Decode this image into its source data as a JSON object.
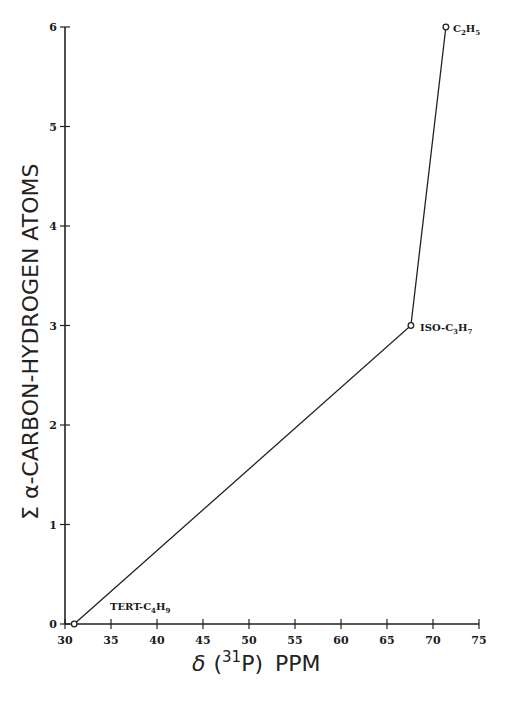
{
  "chart_data": {
    "type": "line",
    "title": "",
    "xlabel": "δ (31P) PPM",
    "ylabel": "Σ α-CARBON-HYDROGEN ATOMS",
    "xlim": [
      30,
      75
    ],
    "ylim": [
      0,
      6
    ],
    "x_ticks": [
      30,
      35,
      40,
      45,
      50,
      55,
      60,
      65,
      70,
      75
    ],
    "y_ticks": [
      0,
      1,
      2,
      3,
      4,
      5,
      6
    ],
    "grid": false,
    "legend": null,
    "series": [
      {
        "name": "alkyl groups",
        "points": [
          {
            "x": 31.0,
            "y": 0,
            "label": "TERT-C4H9"
          },
          {
            "x": 67.6,
            "y": 3,
            "label": "ISO-C3H7"
          },
          {
            "x": 71.4,
            "y": 6,
            "label": "C2H5"
          }
        ]
      }
    ]
  },
  "labels": {
    "xlabel_delta": "δ",
    "xlabel_open": "(",
    "xlabel_sup": "31",
    "xlabel_p": "P)",
    "xlabel_ppm": "PPM",
    "ylabel": "Σ α-CARBON-HYDROGEN ATOMS",
    "pt_tert_main": "TERT-C",
    "pt_tert_sub1": "4",
    "pt_tert_h": "H",
    "pt_tert_sub2": "9",
    "pt_iso_main": "ISO-C",
    "pt_iso_sub1": "3",
    "pt_iso_h": "H",
    "pt_iso_sub2": "7",
    "pt_et_main": "C",
    "pt_et_sub1": "2",
    "pt_et_h": "H",
    "pt_et_sub2": "5"
  }
}
